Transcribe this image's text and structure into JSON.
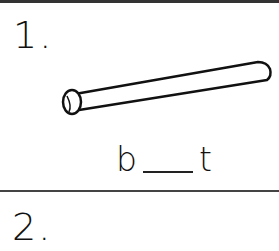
{
  "worksheet": {
    "items": [
      {
        "number": "1.",
        "picture": "baseball-bat",
        "word_start": "b",
        "word_end": "t"
      },
      {
        "number": "2."
      }
    ]
  }
}
